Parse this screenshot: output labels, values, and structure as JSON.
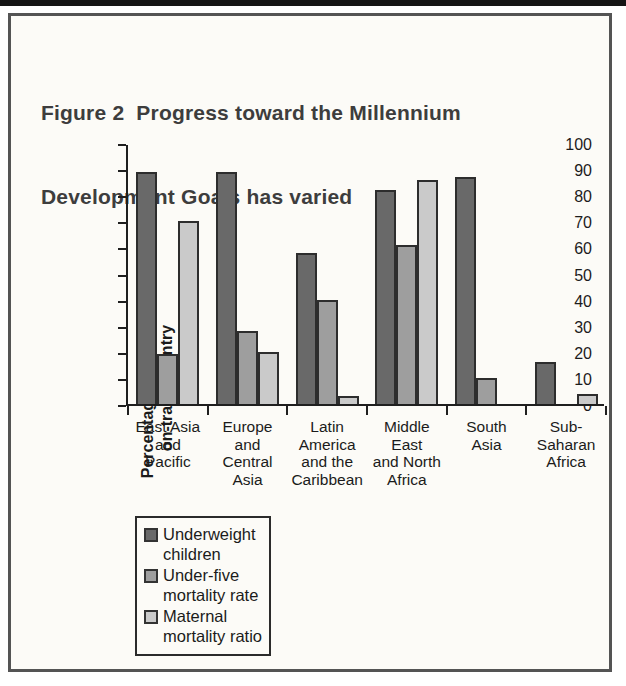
{
  "figure": {
    "title_line1": "Figure 2  Progress toward the Millennium",
    "title_line2": "Development Goals has varied"
  },
  "chart_data": {
    "type": "bar",
    "title": "Figure 2 Progress toward the Millennium Development Goals has varied",
    "xlabel": "",
    "ylabel": "Percentage of people in on-track country",
    "ylabel_lines": [
      "Percentage of people in",
      "on-track country"
    ],
    "ylim": [
      0,
      100
    ],
    "yticks": [
      100,
      90,
      80,
      70,
      60,
      50,
      40,
      30,
      20,
      10,
      0
    ],
    "grid": false,
    "legend_position": "below-left",
    "categories": [
      "East Asia and Pacific",
      "Europe and Central Asia",
      "Latin America and the Caribbean",
      "Middle East and North Africa",
      "South Asia",
      "Sub-Saharan Africa"
    ],
    "category_label_lines": [
      [
        "East Asia",
        "and",
        "Pacific"
      ],
      [
        "Europe",
        "and",
        "Central",
        "Asia"
      ],
      [
        "Latin",
        "America",
        "and the",
        "Caribbean"
      ],
      [
        "Middle",
        "East",
        "and North",
        "Africa"
      ],
      [
        "South",
        "Asia"
      ],
      [
        "Sub-",
        "Saharan",
        "Africa"
      ]
    ],
    "series": [
      {
        "name": "Underweight children",
        "label_lines": [
          "Underweight",
          "children"
        ],
        "color": "#696969",
        "values": [
          89,
          89,
          58,
          82,
          87,
          16
        ]
      },
      {
        "name": "Under-five mortality rate",
        "label_lines": [
          "Under-five",
          "mortality rate"
        ],
        "color": "#9e9e9e",
        "values": [
          19,
          28,
          40,
          61,
          10,
          null
        ]
      },
      {
        "name": "Maternal mortality ratio",
        "label_lines": [
          "Maternal",
          "mortality ratio"
        ],
        "color": "#cacaca",
        "values": [
          70,
          20,
          3,
          86,
          null,
          4
        ]
      }
    ],
    "bar_border_color": "#2d2d2d",
    "axis_color": "#1f1f1f"
  },
  "colors": {
    "figure_background": "#fcfbf7",
    "box_border": "#545454",
    "top_band": "#151515",
    "title_text": "#3d3d3d",
    "label_text": "#1b1b1b"
  }
}
